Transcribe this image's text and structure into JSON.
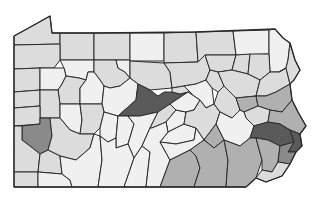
{
  "map": {
    "title": "Pennsylvania counties",
    "palette": {
      "lightest": "#f0f0f0",
      "light": "#dcdcdc",
      "medium": "#b0b0b0",
      "dark": "#8a8a8a",
      "darkest": "#5a5a5a"
    },
    "counties": [
      {
        "name": "Erie",
        "level": "light",
        "points": "14,36 34,25 50,16 52,33 60,33 60,44 14,45"
      },
      {
        "name": "Warren",
        "level": "light",
        "points": "60,33 94,33 94,60 60,60 60,44"
      },
      {
        "name": "McKean",
        "level": "light",
        "points": "94,33 130,33 130,60 94,60"
      },
      {
        "name": "Potter",
        "level": "lightest",
        "points": "130,33 164,33 164,61 130,61"
      },
      {
        "name": "Tioga",
        "level": "light",
        "points": "164,33 196,32 198,62 164,63"
      },
      {
        "name": "Bradford",
        "level": "light",
        "points": "196,32 233,31 236,55 205,55 198,62"
      },
      {
        "name": "Susquehanna",
        "level": "lightest",
        "points": "233,31 269,30 269,54 236,55"
      },
      {
        "name": "Wayne",
        "level": "lightest",
        "points": "269,30 275,29 283,38 290,43 288,60 286,68 279,72 270,72 269,54"
      },
      {
        "name": "Crawford",
        "level": "light",
        "points": "14,45 60,44 60,60 54,68 40,68 14,69"
      },
      {
        "name": "Forest",
        "level": "lightest",
        "points": "60,60 94,60 94,72 88,72 86,80 79,78 66,76 64,68 60,60"
      },
      {
        "name": "Elk",
        "level": "light",
        "points": "94,60 116,60 118,68 125,72 130,78 120,86 110,88 104,86 100,80 94,72"
      },
      {
        "name": "Cameron",
        "level": "lightest",
        "points": "116,60 130,60 130,61 130,78 125,72 118,68"
      },
      {
        "name": "Clinton",
        "level": "light",
        "points": "130,61 164,63 170,72 172,88 150,90 138,84 130,78"
      },
      {
        "name": "Lycoming",
        "level": "light",
        "points": "164,63 198,62 205,55 210,70 206,80 196,84 184,86 172,88 170,72"
      },
      {
        "name": "Sullivan",
        "level": "light",
        "points": "205,55 236,55 232,70 218,72 210,70"
      },
      {
        "name": "Wyoming",
        "level": "light",
        "points": "236,55 250,54 248,74 232,70"
      },
      {
        "name": "Lackawanna",
        "level": "light",
        "points": "250,54 269,54 270,72 260,80 248,74"
      },
      {
        "name": "Mercer",
        "level": "light",
        "points": "14,69 40,68 40,90 14,92"
      },
      {
        "name": "Venango",
        "level": "lightest",
        "points": "40,68 54,68 64,68 66,76 62,84 58,90 40,90"
      },
      {
        "name": "Clarion",
        "level": "light",
        "points": "62,84 66,76 79,78 86,80 80,88 80,104 60,104 58,90"
      },
      {
        "name": "Jefferson",
        "level": "lightest",
        "points": "80,88 86,80 88,72 94,72 100,80 104,86 102,104 80,104"
      },
      {
        "name": "Clearfield",
        "level": "lightest",
        "points": "104,86 110,88 120,86 130,78 138,84 136,100 118,116 104,112 102,104"
      },
      {
        "name": "Centre",
        "level": "darkest",
        "points": "138,84 150,90 158,96 164,92 172,92 180,94 188,92 170,104 158,112 140,116 128,116 118,116 136,100"
      },
      {
        "name": "Union",
        "level": "light",
        "points": "172,88 184,86 190,92 188,92 180,94 172,92"
      },
      {
        "name": "Northumberland",
        "level": "lightest",
        "points": "196,84 206,80 212,88 214,104 206,108 200,100 194,96 190,92 184,86"
      },
      {
        "name": "Columbia",
        "level": "light",
        "points": "206,80 210,70 218,72 224,86 218,92 212,88"
      },
      {
        "name": "Luzerne",
        "level": "light",
        "points": "218,72 232,70 248,74 260,80 256,96 236,98 224,86"
      },
      {
        "name": "Monroe",
        "level": "light",
        "points": "260,80 270,72 279,72 286,68 290,84 276,92 266,96 256,96"
      },
      {
        "name": "Pike",
        "level": "light",
        "points": "279,72 286,68 288,60 290,43 295,60 300,70 294,80 290,84 286,68"
      },
      {
        "name": "Lawrence",
        "level": "light",
        "points": "14,92 40,90 40,106 14,108"
      },
      {
        "name": "Butler",
        "level": "light",
        "points": "40,90 58,90 60,104 60,118 40,118 40,106"
      },
      {
        "name": "Armstrong",
        "level": "lightest",
        "points": "60,104 80,104 82,120 80,134 70,130 60,118"
      },
      {
        "name": "Indiana",
        "level": "light",
        "points": "80,104 102,104 104,112 100,128 94,134 80,134 82,120"
      },
      {
        "name": "Cambria",
        "level": "lightest",
        "points": "104,112 118,116 116,138 108,142 100,136 100,128"
      },
      {
        "name": "Blair",
        "level": "lightest",
        "points": "118,116 128,116 134,124 128,144 116,148 116,138"
      },
      {
        "name": "Huntingdon",
        "level": "lightest",
        "points": "128,116 140,116 158,112 150,128 142,146 134,158 128,144 134,124"
      },
      {
        "name": "Mifflin",
        "level": "light",
        "points": "158,112 170,104 176,110 166,122 152,128 150,128"
      },
      {
        "name": "Juniata",
        "level": "lightest",
        "points": "166,122 176,110 186,112 184,124 168,132"
      },
      {
        "name": "Snyder",
        "level": "lightest",
        "points": "170,104 188,92 194,96 200,100 194,110 186,112 176,110"
      },
      {
        "name": "Perry",
        "level": "lightest",
        "points": "168,132 184,124 196,128 194,140 176,144 160,142"
      },
      {
        "name": "Dauphin",
        "level": "light",
        "points": "194,110 200,100 206,108 214,104 220,112 216,124 204,140 196,128 184,124 186,112"
      },
      {
        "name": "Schuylkill",
        "level": "light",
        "points": "214,104 218,92 224,86 236,98 240,110 232,118 220,112"
      },
      {
        "name": "Carbon",
        "level": "medium",
        "points": "236,98 256,96 258,106 244,112 240,110"
      },
      {
        "name": "Northampton",
        "level": "medium",
        "points": "256,96 266,96 276,92 290,84 292,100 282,112 270,110 258,106"
      },
      {
        "name": "Lehigh",
        "level": "light",
        "points": "244,112 258,106 270,110 268,122 254,126 246,118"
      },
      {
        "name": "Bucks",
        "level": "medium",
        "points": "270,110 282,112 292,100 298,112 306,126 300,134 290,130 280,124 268,122"
      },
      {
        "name": "Berks",
        "level": "lightest",
        "points": "232,118 240,110 244,112 246,118 254,126 250,138 240,146 224,140 216,124 220,112"
      },
      {
        "name": "Montgomery",
        "level": "darkest",
        "points": "254,126 268,122 280,124 290,130 294,142 280,146 268,140 256,138 250,138"
      },
      {
        "name": "Philadelphia",
        "level": "darkest",
        "points": "290,130 300,134 302,146 296,152 288,152 294,142"
      },
      {
        "name": "Lebanon",
        "level": "medium",
        "points": "204,140 216,124 224,140 214,148"
      },
      {
        "name": "Beaver",
        "level": "light",
        "points": "14,108 40,106 40,124 14,126"
      },
      {
        "name": "Allegheny",
        "level": "dark",
        "points": "22,126 40,124 40,118 50,118 52,136 48,150 40,154 30,146 22,140"
      },
      {
        "name": "Westmoreland",
        "level": "light",
        "points": "52,136 50,118 60,118 70,130 80,134 94,134 90,148 76,160 60,156 48,150"
      },
      {
        "name": "Washington",
        "level": "light",
        "points": "14,126 22,126 22,140 30,146 40,154 38,172 14,172"
      },
      {
        "name": "Fayette",
        "level": "light",
        "points": "40,154 48,150 60,156 62,174 38,172"
      },
      {
        "name": "Greene",
        "level": "light",
        "points": "14,172 38,172 38,187 14,187"
      },
      {
        "name": "Fayette-S",
        "level": "lightest",
        "points": "38,172 62,174 70,180 72,187 38,187"
      },
      {
        "name": "Somerset",
        "level": "lightest",
        "points": "60,156 76,160 90,148 94,134 100,136 102,160 98,187 72,187 70,180 62,174"
      },
      {
        "name": "Bedford",
        "level": "lightest",
        "points": "100,136 108,142 116,138 116,148 128,144 134,158 124,187 98,187 102,160"
      },
      {
        "name": "Fulton",
        "level": "lightest",
        "points": "134,158 142,146 150,152 146,187 124,187"
      },
      {
        "name": "Franklin",
        "level": "lightest",
        "points": "142,146 150,128 152,128 166,122 168,132 160,142 170,160 160,187 146,187 150,152"
      },
      {
        "name": "Cumberland",
        "level": "lightest",
        "points": "160,142 176,144 194,140 196,128 204,140 190,150 170,160"
      },
      {
        "name": "Adams",
        "level": "medium",
        "points": "170,160 190,150 196,156 200,168 194,187 160,187"
      },
      {
        "name": "York",
        "level": "medium",
        "points": "190,150 204,140 214,148 224,140 228,160 226,187 194,187 200,168 196,156"
      },
      {
        "name": "Lancaster",
        "level": "medium",
        "points": "224,140 240,146 250,138 256,138 262,160 256,178 246,187 226,187 228,160"
      },
      {
        "name": "Chester",
        "level": "medium",
        "points": "256,138 268,140 280,146 278,162 272,172 262,170 262,160"
      },
      {
        "name": "Delaware",
        "level": "dark",
        "points": "280,146 294,142 288,152 296,152 290,164 278,162"
      },
      {
        "name": "Chester-S",
        "level": "light",
        "points": "262,170 272,172 278,162 290,164 282,176 266,182 256,178"
      }
    ]
  }
}
